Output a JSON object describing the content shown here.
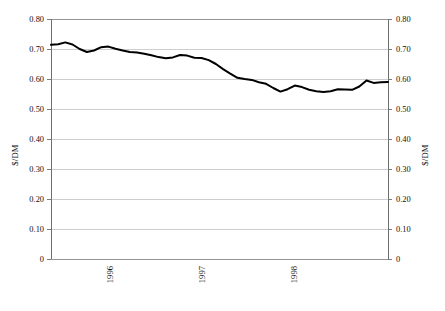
{
  "chart_data": {
    "type": "line",
    "title": "",
    "subtitle": "",
    "xlabel": "",
    "ylabel": "$/DM",
    "ylabel_right": "$/DM",
    "ylim": [
      0,
      0.8
    ],
    "xlim": [
      0,
      47
    ],
    "grid": true,
    "legend": null,
    "legend_position": "none",
    "y_ticks": [
      0.8,
      0.7,
      0.6,
      0.5,
      0.4,
      0.3,
      0.2,
      0.1,
      0
    ],
    "y_tick_labels": [
      "0.80",
      "0.70",
      "0.60",
      "0.50",
      "0.40",
      "0.30",
      "0.20",
      "0.10",
      "0"
    ],
    "y_tick_labels_right": [
      "0.80",
      "0.70",
      "0.60",
      "0.50",
      "0.40",
      "0.30",
      "0.20",
      "0.10",
      "0"
    ],
    "x_tick_labels": [
      "1996",
      "1997",
      "1998"
    ],
    "x_tick_positions": [
      11,
      23,
      35
    ],
    "series": [
      {
        "name": "$/DM exchange rate",
        "color": "#000000",
        "x": [
          0,
          1,
          2,
          3,
          4,
          5,
          6,
          7,
          8,
          9,
          10,
          11,
          12,
          13,
          14,
          15,
          16,
          17,
          18,
          19,
          20,
          21,
          22,
          23,
          24,
          25,
          26,
          27,
          28,
          29,
          30,
          31,
          32,
          33,
          34,
          35,
          36,
          37,
          38,
          39,
          40,
          41,
          42,
          43,
          44,
          45,
          46,
          47
        ],
        "values": [
          0.714,
          0.716,
          0.722,
          0.715,
          0.7,
          0.69,
          0.695,
          0.706,
          0.708,
          0.701,
          0.695,
          0.69,
          0.688,
          0.684,
          0.679,
          0.673,
          0.669,
          0.672,
          0.68,
          0.678,
          0.671,
          0.67,
          0.663,
          0.65,
          0.633,
          0.618,
          0.604,
          0.6,
          0.597,
          0.589,
          0.584,
          0.57,
          0.558,
          0.566,
          0.578,
          0.573,
          0.564,
          0.559,
          0.557,
          0.559,
          0.566,
          0.565,
          0.564,
          0.575,
          0.595,
          0.587,
          0.589,
          0.59
        ]
      }
    ]
  },
  "axes": {
    "left_title": "$/DM",
    "right_title": "$/DM"
  }
}
